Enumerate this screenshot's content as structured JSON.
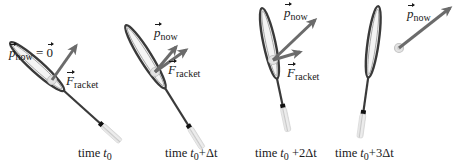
{
  "figure": {
    "colors": {
      "arrow": "#6b6b6b",
      "racket_frame": "#3a3a3a",
      "racket_grip": "#e2e2e2",
      "ball": "#d8d8d8",
      "text": "#1a1a1a"
    },
    "panels": [
      {
        "time_label": {
          "prefix": "time ",
          "t": "t",
          "sub": "0",
          "suffix": ""
        },
        "momentum_label": {
          "symbol": "p",
          "sub": "now",
          "equals": " = ",
          "zero": "0"
        },
        "force_label": {
          "symbol": "F",
          "sub": "racket"
        }
      },
      {
        "time_label": {
          "prefix": "time ",
          "t": "t",
          "sub": "0",
          "suffix": "+Δt"
        },
        "momentum_label": {
          "symbol": "p",
          "sub": "now"
        },
        "force_label": {
          "symbol": "F",
          "sub": "racket"
        }
      },
      {
        "time_label": {
          "prefix": "time ",
          "t": "t",
          "sub": "0",
          "suffix": " +2Δt"
        },
        "momentum_label": {
          "symbol": "p",
          "sub": "now"
        },
        "force_label": {
          "symbol": "F",
          "sub": "racket"
        }
      },
      {
        "time_label": {
          "prefix": "time ",
          "t": "t",
          "sub": "0",
          "suffix": "+3Δt"
        },
        "momentum_label": {
          "symbol": "p",
          "sub": "now"
        }
      }
    ]
  }
}
